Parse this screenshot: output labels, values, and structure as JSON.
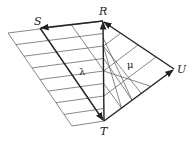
{
  "diagram": {
    "type": "vector-grid-diagram",
    "points": {
      "R": {
        "label": "R",
        "x": 103,
        "y": 21
      },
      "S": {
        "label": "S",
        "x": 40,
        "y": 28
      },
      "T": {
        "label": "T",
        "x": 104,
        "y": 121
      },
      "U": {
        "label": "U",
        "x": 174,
        "y": 69
      }
    },
    "vectors": [
      {
        "from": "T",
        "to": "R"
      },
      {
        "from": "R",
        "to": "S"
      },
      {
        "from": "T",
        "to": "S"
      },
      {
        "from": "T",
        "to": "U"
      },
      {
        "from": "U",
        "to": "R"
      }
    ],
    "region_labels": {
      "lambda": "λ",
      "mu": "μ"
    },
    "colors": {
      "lines": "#222222",
      "grid": "#555555",
      "background": "#ffffff"
    }
  }
}
